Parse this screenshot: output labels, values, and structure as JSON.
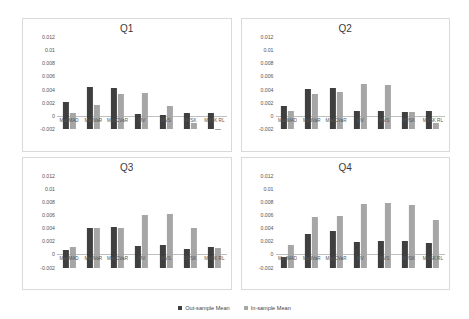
{
  "legend": {
    "items": [
      {
        "label": "Out-sample Mean",
        "color": "#3f3f3f",
        "key": "out"
      },
      {
        "label": "In-sample Mean",
        "color": "#a6a6a6",
        "key": "in"
      }
    ]
  },
  "axis": {
    "ticks": [
      "0.012",
      "0.01",
      "0.008",
      "0.006",
      "0.004",
      "0.002",
      "0",
      "-0.002"
    ],
    "min": -0.002,
    "max": 0.012
  },
  "chart_data": [
    {
      "type": "bar",
      "title": "Q1",
      "xlabel": "",
      "ylabel": "",
      "ylim": [
        -0.002,
        0.012
      ],
      "yticks": [
        0.012,
        0.01,
        0.008,
        0.006,
        0.004,
        0.002,
        0,
        -0.002
      ],
      "grid": false,
      "legend_position": "bottom-figure",
      "categories": [
        "MadMAD",
        "MadVaR",
        "MadCVaR",
        "MV",
        "MVS",
        "MVSK",
        "MVSK RL"
      ],
      "series": [
        {
          "name": "Out-sample Mean",
          "values": [
            0.00415,
            0.00635,
            0.0063,
            0.00225,
            0.0022,
            0.00245,
            0.0025
          ]
        },
        {
          "name": "In-sample Mean",
          "values": [
            0.00245,
            0.0037,
            0.0053,
            0.00545,
            0.00345,
            0.00095,
            5e-05
          ]
        }
      ]
    },
    {
      "type": "bar",
      "title": "Q2",
      "xlabel": "",
      "ylabel": "",
      "ylim": [
        -0.002,
        0.012
      ],
      "yticks": [
        0.012,
        0.01,
        0.008,
        0.006,
        0.004,
        0.002,
        0,
        -0.002
      ],
      "grid": false,
      "legend_position": "bottom-figure",
      "categories": [
        "MadMAD",
        "MadVaR",
        "MadCVaR",
        "MV",
        "MVS",
        "MVSK",
        "MVSK RL"
      ],
      "series": [
        {
          "name": "Out-sample Mean",
          "values": [
            0.0035,
            0.00605,
            0.0062,
            0.0027,
            0.0027,
            0.00255,
            0.0028
          ]
        },
        {
          "name": "In-sample Mean",
          "values": [
            0.0028,
            0.0054,
            0.00565,
            0.0069,
            0.0067,
            0.00255,
            0.00085
          ]
        }
      ]
    },
    {
      "type": "bar",
      "title": "Q3",
      "xlabel": "",
      "ylabel": "",
      "ylim": [
        -0.002,
        0.012
      ],
      "yticks": [
        0.012,
        0.01,
        0.008,
        0.006,
        0.004,
        0.002,
        0,
        -0.002
      ],
      "grid": false,
      "legend_position": "bottom-figure",
      "categories": [
        "MadMAD",
        "MadVaR",
        "MadCVaR",
        "MV",
        "MVS",
        "MVSK",
        "MVSK RL"
      ],
      "series": [
        {
          "name": "Out-sample Mean",
          "values": [
            0.0026,
            0.00595,
            0.00615,
            0.0033,
            0.0034,
            0.00285,
            0.00315
          ]
        },
        {
          "name": "In-sample Mean",
          "values": [
            0.00305,
            0.006,
            0.006,
            0.008,
            0.0082,
            0.006,
            0.00295
          ]
        }
      ]
    },
    {
      "type": "bar",
      "title": "Q4",
      "xlabel": "",
      "ylabel": "",
      "ylim": [
        -0.002,
        0.012
      ],
      "yticks": [
        0.012,
        0.01,
        0.008,
        0.006,
        0.004,
        0.002,
        0,
        -0.002
      ],
      "grid": false,
      "legend_position": "bottom-figure",
      "categories": [
        "MadMAD",
        "MadVaR",
        "MadCVaR",
        "MV",
        "MVS",
        "MVSK",
        "MVSK RL"
      ],
      "series": [
        {
          "name": "Out-sample Mean",
          "values": [
            0.00155,
            0.0051,
            0.0055,
            0.00395,
            0.0041,
            0.0041,
            0.0038
          ]
        },
        {
          "name": "In-sample Mean",
          "values": [
            0.00345,
            0.0077,
            0.00785,
            0.0096,
            0.0098,
            0.0095,
            0.0072
          ]
        }
      ]
    }
  ]
}
